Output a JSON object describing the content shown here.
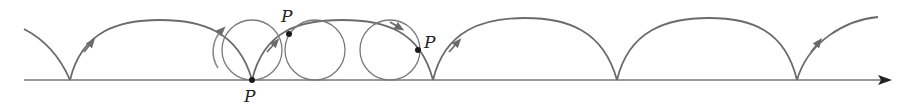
{
  "diagram": {
    "colors": {
      "curve": "#6b6b6b",
      "axis": "#777777",
      "point": "#1a1a1a",
      "label": "#222222"
    },
    "labels": [
      {
        "text": "P",
        "x": 244,
        "y": 102
      },
      {
        "text": "P",
        "x": 281,
        "y": 22
      },
      {
        "text": "P",
        "x": 424,
        "y": 48
      }
    ],
    "cusps_x": [
      70,
      252,
      433,
      617,
      797
    ],
    "baseline_y": 80,
    "circles": [
      {
        "cx": 252,
        "cy": 50,
        "r": 30
      },
      {
        "cx": 315,
        "cy": 50,
        "r": 30
      },
      {
        "cx": 390,
        "cy": 50,
        "r": 30
      }
    ],
    "points": [
      {
        "x": 252,
        "y": 80
      },
      {
        "x": 289,
        "y": 34
      },
      {
        "x": 418,
        "y": 50
      }
    ]
  }
}
